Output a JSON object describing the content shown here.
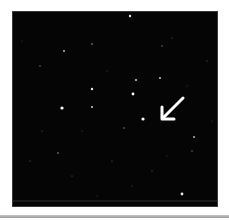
{
  "image": {
    "subject": "star field",
    "background_color": "#050505",
    "annotation": {
      "type": "arrow",
      "icon": "arrow-down-left-icon",
      "color": "#ffffff",
      "points_to": "target star"
    },
    "colors": {
      "star": "#ffffff",
      "frame_border": "#3a3a3a",
      "page_background": "#ffffff"
    }
  }
}
